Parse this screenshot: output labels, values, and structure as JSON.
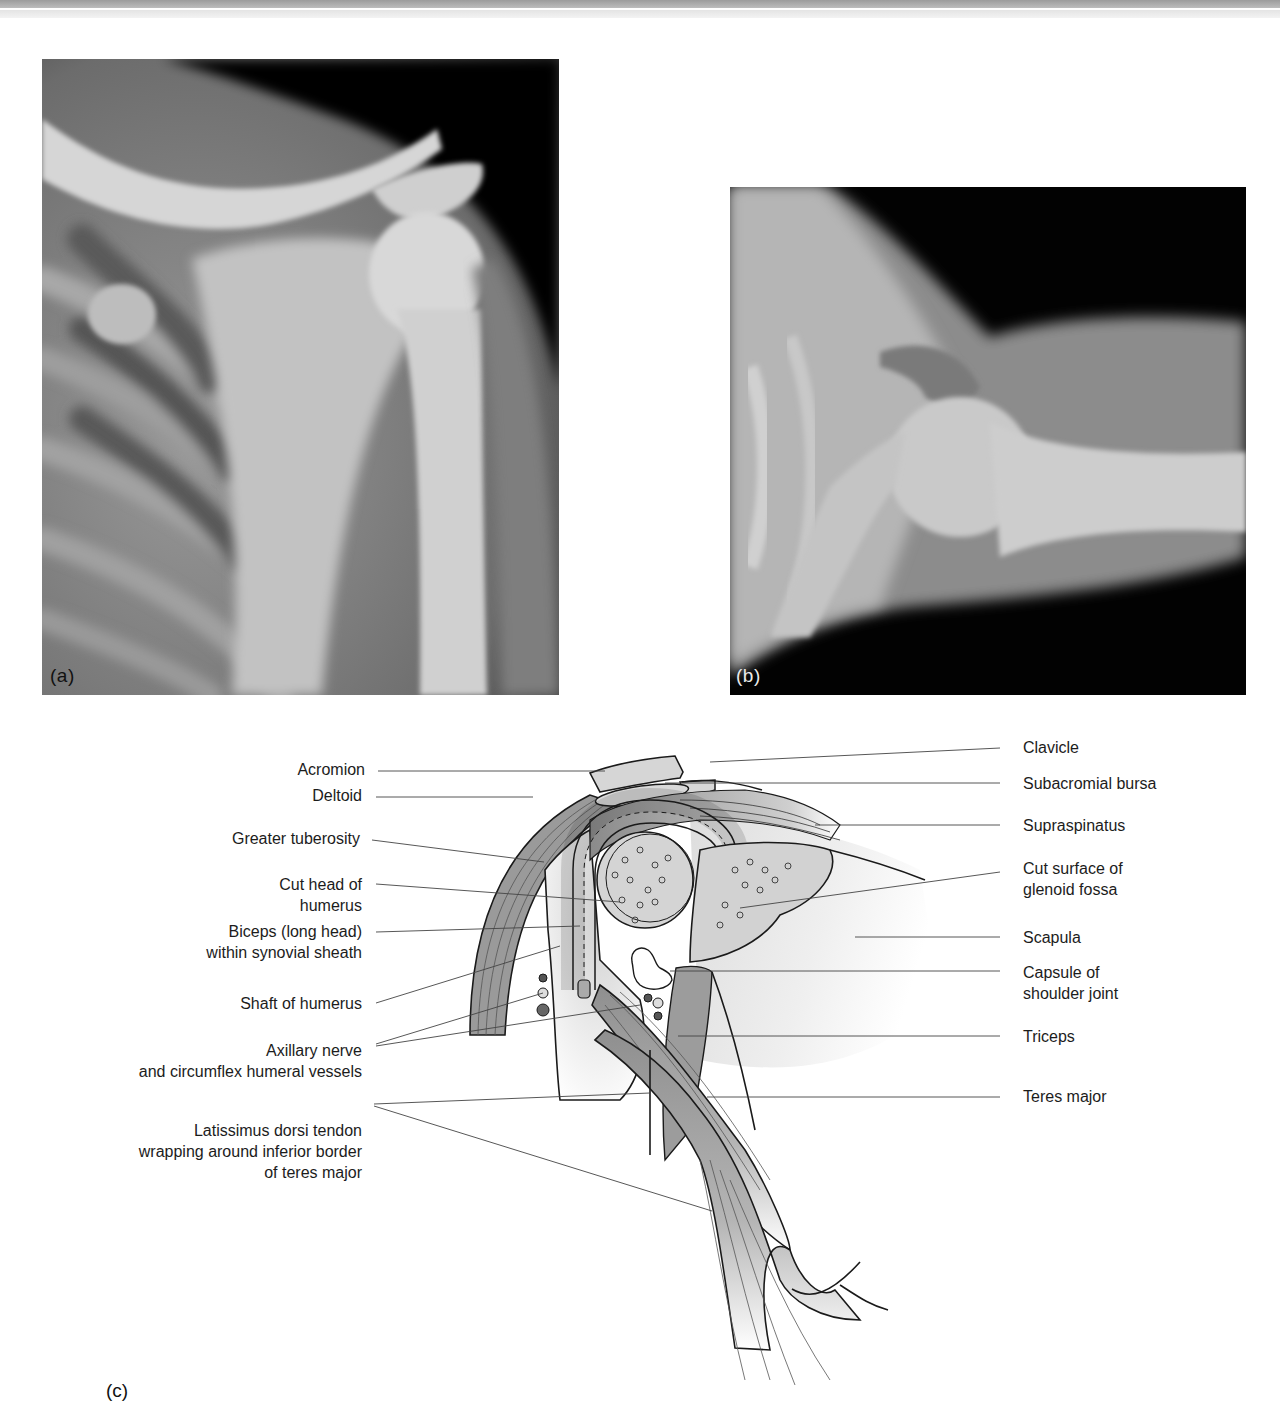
{
  "figure": {
    "panels": [
      {
        "id": "a",
        "label": "(a)",
        "type": "x-ray",
        "view": "anteroposterior shoulder radiograph"
      },
      {
        "id": "b",
        "label": "(b)",
        "type": "x-ray",
        "view": "axial shoulder radiograph"
      },
      {
        "id": "c",
        "label": "(c)",
        "type": "anatomical diagram",
        "view": "coronal section of shoulder joint"
      }
    ],
    "diagram": {
      "left_labels": [
        {
          "lines": [
            "Acromion"
          ]
        },
        {
          "lines": [
            "Deltoid"
          ]
        },
        {
          "lines": [
            "Greater tuberosity"
          ]
        },
        {
          "lines": [
            "Cut head of",
            "humerus"
          ]
        },
        {
          "lines": [
            "Biceps (long head)",
            "within synovial sheath"
          ]
        },
        {
          "lines": [
            "Shaft of humerus"
          ]
        },
        {
          "lines": [
            "Axillary nerve",
            "and circumflex humeral vessels"
          ]
        },
        {
          "lines": [
            "Latissimus dorsi tendon",
            "wrapping around inferior border",
            "of teres major"
          ]
        }
      ],
      "right_labels": [
        {
          "lines": [
            "Clavicle"
          ]
        },
        {
          "lines": [
            "Subacromial bursa"
          ]
        },
        {
          "lines": [
            "Supraspinatus"
          ]
        },
        {
          "lines": [
            "Cut surface of",
            "glenoid fossa"
          ]
        },
        {
          "lines": [
            "Scapula"
          ]
        },
        {
          "lines": [
            "Capsule of",
            "shoulder joint"
          ]
        },
        {
          "lines": [
            "Triceps"
          ]
        },
        {
          "lines": [
            "Teres major"
          ]
        }
      ]
    },
    "colors": {
      "xray_dark": "#050505",
      "xray_bone": "#d9d9d9",
      "diagram_fill": "#c8c8c8",
      "diagram_line": "#1a1a1a"
    }
  }
}
